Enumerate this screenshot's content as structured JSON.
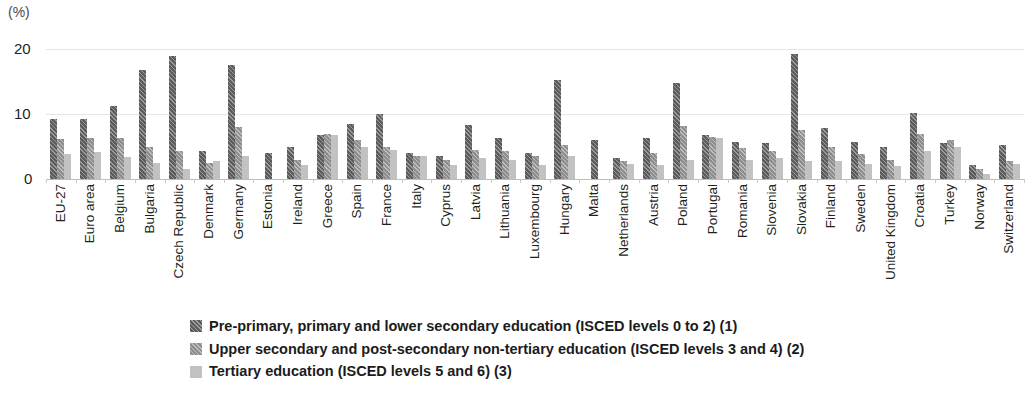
{
  "units_label": "(%)",
  "legend": [
    {
      "label": "Pre-primary, primary and lower secondary education (ISCED levels 0 to 2) (1)",
      "color": "#5c5c5c"
    },
    {
      "label": "Upper secondary and post-secondary non-tertiary education (ISCED levels 3 and 4) (2)",
      "color": "#8e8e8e"
    },
    {
      "label": "Tertiary education (ISCED levels 5 and 6) (3)",
      "color": "#c2c2c2"
    }
  ],
  "chart_data": {
    "type": "bar",
    "title": "",
    "subtitle": "",
    "xlabel": "",
    "ylabel": "(%)",
    "ylim": [
      0,
      20
    ],
    "yticks": [
      "0",
      "10",
      "20"
    ],
    "grid": true,
    "legend_position": "bottom-left",
    "categories": [
      "EU-27",
      "Euro area",
      "Belgium",
      "Bulgaria",
      "Czech Republic",
      "Denmark",
      "Germany",
      "Estonia",
      "Ireland",
      "Greece",
      "Spain",
      "France",
      "Italy",
      "Cyprus",
      "Latvia",
      "Lithuania",
      "Luxembourg",
      "Hungary",
      "Malta",
      "Netherlands",
      "Austria",
      "Poland",
      "Portugal",
      "Romania",
      "Slovenia",
      "Slovakia",
      "Finland",
      "Sweden",
      "United Kingdom",
      "Croatia",
      "Turkey",
      "Norway",
      "Switzerland"
    ],
    "series": [
      {
        "name": "Pre-primary, primary and lower secondary education (ISCED levels 0 to 2) (1)",
        "color": "#5c5c5c",
        "values": [
          9.2,
          9.2,
          11.2,
          16.8,
          19.0,
          4.3,
          17.5,
          4.0,
          5.0,
          6.8,
          8.5,
          10.0,
          4.0,
          3.5,
          8.3,
          6.3,
          4.0,
          15.3,
          6.0,
          3.3,
          6.3,
          14.8,
          6.7,
          5.7,
          5.5,
          19.3,
          7.8,
          5.7,
          5.0,
          10.2,
          5.5,
          2.2,
          5.3
        ]
      },
      {
        "name": "Upper secondary and post-secondary non-tertiary education (ISCED levels 3 and 4) (2)",
        "color": "#8e8e8e",
        "values": [
          6.1,
          6.3,
          6.3,
          5.0,
          4.3,
          2.5,
          8.0,
          null,
          3.0,
          7.0,
          6.0,
          5.0,
          3.6,
          3.0,
          4.5,
          4.3,
          3.5,
          5.2,
          null,
          2.7,
          4.0,
          8.2,
          6.5,
          4.7,
          4.3,
          7.6,
          5.0,
          3.8,
          3.0,
          7.0,
          6.0,
          1.5,
          2.8
        ]
      },
      {
        "name": "Tertiary education (ISCED levels 5 and 6) (3)",
        "color": "#c2c2c2",
        "values": [
          3.9,
          4.1,
          3.4,
          2.4,
          1.5,
          2.8,
          3.6,
          null,
          2.2,
          6.8,
          5.0,
          4.5,
          3.5,
          2.2,
          3.3,
          3.0,
          2.2,
          3.5,
          null,
          2.3,
          2.2,
          3.0,
          6.3,
          3.0,
          3.2,
          2.8,
          2.7,
          2.3,
          2.0,
          4.3,
          5.0,
          0.7,
          2.3
        ]
      }
    ]
  }
}
